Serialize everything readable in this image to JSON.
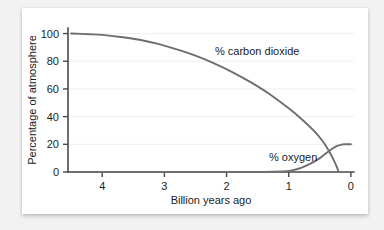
{
  "chart_data": {
    "type": "line",
    "title": "",
    "xlabel": "Billion years ago",
    "ylabel": "Percentage of atmosphere",
    "xlim": [
      4.55,
      -0.05
    ],
    "ylim": [
      0,
      104
    ],
    "x_ticks": [
      "4",
      "3",
      "2",
      "1",
      "0"
    ],
    "x_tick_values": [
      4,
      3,
      2,
      1,
      0
    ],
    "y_ticks": [
      "0",
      "20",
      "40",
      "60",
      "80",
      "100"
    ],
    "y_tick_values": [
      0,
      20,
      40,
      60,
      80,
      100
    ],
    "grid": "horizontal-faint",
    "legend": "inline-annotations",
    "x_axis_direction": "reversed",
    "series": [
      {
        "name": "% carbon dioxide",
        "annotation": "% carbon dioxide",
        "color": "#6e6e6e",
        "x": [
          4.5,
          4.2,
          4.0,
          3.7,
          3.4,
          3.1,
          2.8,
          2.5,
          2.2,
          1.9,
          1.6,
          1.3,
          1.0,
          0.8,
          0.6,
          0.45,
          0.35,
          0.28,
          0.22,
          0.2
        ],
        "y": [
          100,
          99.5,
          99,
          97.5,
          95.5,
          92.5,
          88.5,
          84,
          78.5,
          72,
          64.5,
          56,
          46,
          38.5,
          30,
          22,
          15,
          9,
          3,
          0
        ]
      },
      {
        "name": "% oxygen",
        "annotation": "% oxygen",
        "color": "#6e6e6e",
        "x": [
          4.5,
          2.0,
          1.4,
          1.1,
          0.95,
          0.8,
          0.65,
          0.5,
          0.4,
          0.3,
          0.22,
          0.15,
          0.1,
          0.0
        ],
        "y": [
          0,
          0,
          0,
          0.4,
          1.2,
          3.0,
          6.0,
          10.0,
          13.5,
          16.8,
          18.8,
          19.8,
          20.0,
          20.0
        ]
      }
    ],
    "annotations": [
      {
        "text": "% carbon dioxide",
        "x_px": 193,
        "y_px": 47
      },
      {
        "text": "% oxygen",
        "x_px": 247,
        "y_px": 153
      }
    ]
  }
}
